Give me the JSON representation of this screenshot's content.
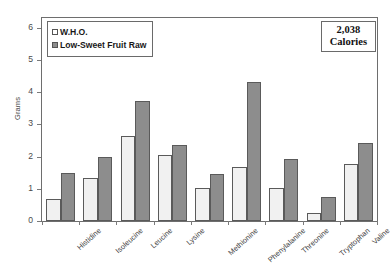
{
  "chart_data": {
    "type": "bar",
    "title": "",
    "subtitle": "",
    "xlabel": "",
    "ylabel": "Grams",
    "ylim": [
      0,
      6.3
    ],
    "yticks": [
      0,
      1,
      2,
      3,
      4,
      5,
      6
    ],
    "ytick_labels": [
      "0",
      "1",
      "2",
      "3",
      "4",
      "5",
      "6"
    ],
    "grid": false,
    "legend_position": "upper-left",
    "categories": [
      "Histidine",
      "Isoleucine",
      "Leucine",
      "Lysine",
      "Methionine",
      "Phenylalanine",
      "Threonine",
      "Tryptophan",
      "Valine"
    ],
    "series": [
      {
        "name": "W.H.O.",
        "color": "#f1f1f1",
        "values": [
          0.68,
          1.35,
          2.65,
          2.04,
          1.01,
          1.69,
          1.01,
          0.26,
          1.77
        ]
      },
      {
        "name": "Low-Sweet Fruit Raw",
        "color": "#8d8d8d",
        "values": [
          1.5,
          2.0,
          3.71,
          2.35,
          1.45,
          4.31,
          1.91,
          0.73,
          2.43
        ]
      }
    ],
    "annotations": [
      {
        "name": "calories-callout",
        "line1": "2,038",
        "line2": "Calories",
        "position": "upper-right"
      }
    ]
  },
  "legend": {
    "items": [
      {
        "label": "W.H.O.",
        "swatch": "who"
      },
      {
        "label": "Low-Sweet Fruit Raw",
        "swatch": "fruit"
      }
    ]
  },
  "calories": {
    "number": "2,038",
    "unit": "Calories"
  },
  "axis": {
    "y_title": "Grams"
  }
}
